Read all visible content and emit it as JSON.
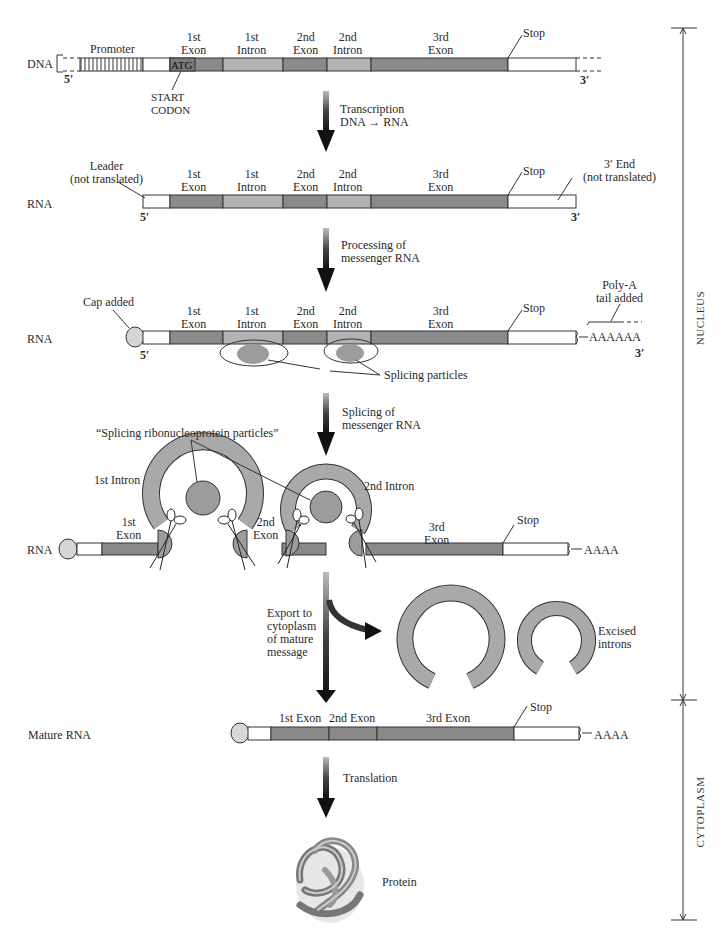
{
  "figure": {
    "rows": {
      "dna": {
        "label": "DNA",
        "five_prime": "5′",
        "three_prime": "3′",
        "segments": {
          "promoter": "Promoter",
          "exon1": "1st\nExon",
          "intron1": "1st\nIntron",
          "exon2": "2nd\nExon",
          "intron2": "2nd\nIntron",
          "exon3": "3rd\nExon",
          "stop": "Stop"
        },
        "atg": "ATG",
        "start_codon": "START\nCODON"
      },
      "rna1": {
        "label": "RNA",
        "leader": "Leader\n(not translated)",
        "five_prime": "5′",
        "three_prime": "3′",
        "segments": {
          "exon1": "1st\nExon",
          "intron1": "1st\nIntron",
          "exon2": "2nd\nExon",
          "intron2": "2nd\nIntron",
          "exon3": "3rd\nExon",
          "stop": "Stop"
        },
        "three_end": "3′ End\n(not translated)"
      },
      "rna2": {
        "label": "RNA",
        "cap": "Cap added",
        "five_prime": "5′",
        "three_prime": "3′",
        "segments": {
          "exon1": "1st\nExon",
          "intron1": "1st\nIntron",
          "exon2": "2nd\nExon",
          "intron2": "2nd\nIntron",
          "exon3": "3rd\nExon",
          "stop": "Stop"
        },
        "poly_a": "Poly-A\ntail added",
        "tail": "AAAAAA",
        "splicing_particles": "Splicing particles"
      },
      "rna3": {
        "label": "RNA",
        "snrnp": "“Splicing ribonucleoprotein particles”",
        "intron1": "1st Intron",
        "intron2": "2nd Intron",
        "exon1": "1st\nExon",
        "exon2": "2nd\nExon",
        "exon3": "3rd\nExon",
        "stop": "Stop",
        "tail": "AAAA"
      },
      "mature": {
        "label": "Mature RNA",
        "exon1": "1st Exon",
        "exon2": "2nd Exon",
        "exon3": "3rd Exon",
        "stop": "Stop",
        "tail": "AAAA"
      }
    },
    "steps": {
      "transcription": "Transcription\nDNA → RNA",
      "processing": "Processing of\nmessenger RNA",
      "splicing": "Splicing of\nmessenger RNA",
      "export": "Export to\ncytoplasm\nof mature\nmessage",
      "translation": "Translation"
    },
    "excised": "Excised\nintrons",
    "protein": "Protein",
    "compartments": {
      "nucleus": "NUCLEUS",
      "cytoplasm": "CYTOPLASM"
    },
    "colors": {
      "exon": "#8a8a8a",
      "intron": "#b3b3b3",
      "utr": "#ffffff",
      "particle": "#9c9c9c",
      "ring": "#a9a9a9",
      "cap": "#d6d6d6",
      "outline": "#333333"
    }
  }
}
